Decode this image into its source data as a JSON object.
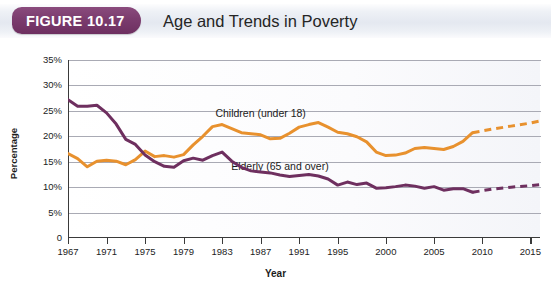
{
  "figure": {
    "badge_label": "FIGURE 10.17",
    "title": "Age and Trends in Poverty"
  },
  "colors": {
    "children_series": "#E8912E",
    "elderly_series": "#6E2F5F",
    "badge": "#7B3C6E",
    "gridline": "#A9AAB4",
    "axis": "#3A3A3A"
  },
  "chart_data": {
    "type": "line",
    "title": "Age and Trends in Poverty",
    "xlabel": "Year",
    "ylabel": "Percentage",
    "xlim": [
      1967,
      2016
    ],
    "ylim": [
      0,
      35
    ],
    "ytick_labels": [
      "0",
      "5%",
      "10%",
      "15%",
      "20%",
      "25%",
      "30%",
      "35%"
    ],
    "ytick_values": [
      0,
      5,
      10,
      15,
      20,
      25,
      30,
      35
    ],
    "xtick_labels": [
      "1967",
      "1971",
      "1975",
      "1979",
      "1983",
      "1987",
      "1991",
      "1995",
      "2000",
      "2005",
      "2010",
      "2015"
    ],
    "xtick_values": [
      1967,
      1971,
      1975,
      1979,
      1983,
      1987,
      1991,
      1995,
      2000,
      2005,
      2010,
      2015
    ],
    "grid": "horizontal",
    "legend_position": "inline-annotation",
    "projection_note": "Dashed segments after 2009 are projections",
    "series": [
      {
        "name": "Children (under 18)",
        "color": "#E8912E",
        "label_x": 1987,
        "label_y": 24.3,
        "solid": {
          "x": [
            1967,
            1968,
            1969,
            1970,
            1971,
            1972,
            1973,
            1974,
            1975,
            1976,
            1977,
            1978,
            1979,
            1980,
            1981,
            1982,
            1983,
            1984,
            1985,
            1986,
            1987,
            1988,
            1989,
            1990,
            1991,
            1992,
            1993,
            1994,
            1995,
            1996,
            1997,
            1998,
            1999,
            2000,
            2001,
            2002,
            2003,
            2004,
            2005,
            2006,
            2007,
            2008,
            2009
          ],
          "y": [
            16.6,
            15.6,
            14.0,
            15.1,
            15.3,
            15.1,
            14.4,
            15.4,
            17.1,
            16.0,
            16.2,
            15.9,
            16.4,
            18.3,
            20.0,
            21.9,
            22.3,
            21.5,
            20.7,
            20.5,
            20.3,
            19.5,
            19.6,
            20.6,
            21.8,
            22.3,
            22.7,
            21.8,
            20.8,
            20.5,
            19.9,
            18.9,
            16.9,
            16.2,
            16.3,
            16.7,
            17.6,
            17.8,
            17.6,
            17.4,
            18.0,
            19.0,
            20.7
          ]
        },
        "dashed": {
          "x": [
            2009,
            2011,
            2013,
            2015,
            2016
          ],
          "y": [
            20.7,
            21.4,
            22.0,
            22.6,
            23.0
          ]
        }
      },
      {
        "name": "Elderly (65 and over)",
        "color": "#6E2F5F",
        "label_x": 1989,
        "label_y": 14.0,
        "solid": {
          "x": [
            1967,
            1968,
            1969,
            1970,
            1971,
            1972,
            1973,
            1974,
            1975,
            1976,
            1977,
            1978,
            1979,
            1980,
            1981,
            1982,
            1983,
            1984,
            1985,
            1986,
            1987,
            1988,
            1989,
            1990,
            1991,
            1992,
            1993,
            1994,
            1995,
            1996,
            1997,
            1998,
            1999,
            2000,
            2001,
            2002,
            2003,
            2004,
            2005,
            2006,
            2007,
            2008,
            2009
          ],
          "y": [
            27.2,
            25.9,
            25.9,
            26.1,
            24.6,
            22.4,
            19.4,
            18.4,
            16.3,
            15.0,
            14.1,
            13.9,
            15.2,
            15.7,
            15.3,
            16.2,
            16.9,
            15.1,
            13.9,
            13.2,
            13.0,
            12.8,
            12.4,
            12.1,
            12.3,
            12.5,
            12.2,
            11.6,
            10.4,
            11.0,
            10.5,
            10.8,
            9.8,
            9.9,
            10.1,
            10.4,
            10.2,
            9.8,
            10.1,
            9.4,
            9.7,
            9.7,
            9.0
          ]
        },
        "dashed": {
          "x": [
            2009,
            2011,
            2013,
            2015,
            2016
          ],
          "y": [
            9.0,
            9.6,
            10.0,
            10.3,
            10.5
          ]
        }
      }
    ]
  }
}
